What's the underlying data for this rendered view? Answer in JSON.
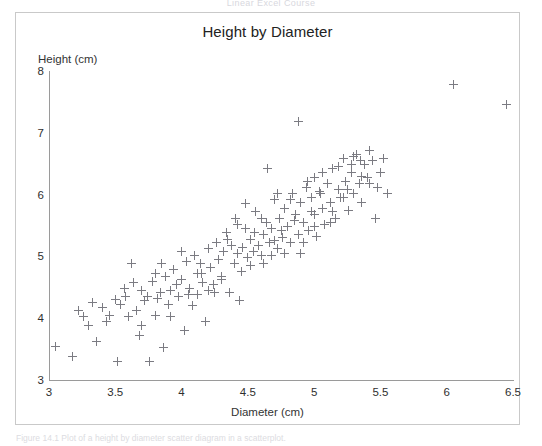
{
  "page": {
    "running_head": "Linear Excel Course",
    "figure_caption": "Figure 14.1  Plot of a height by diameter scatter diagram in a scatterplot."
  },
  "chart_data": {
    "type": "scatter",
    "title": "Height by Diameter",
    "xlabel": "Diameter (cm)",
    "ylabel": "Height (cm)",
    "xlim": [
      3,
      6.5
    ],
    "ylim": [
      3,
      8
    ],
    "xticks": [
      "3",
      "3.5",
      "4",
      "4.5",
      "5",
      "5.5",
      "6",
      "6.5"
    ],
    "xtick_values": [
      3,
      3.5,
      4,
      4.5,
      5,
      5.5,
      6,
      6.5
    ],
    "yticks": [
      "3",
      "4",
      "5",
      "6",
      "7",
      "8"
    ],
    "ytick_values": [
      3,
      4,
      5,
      6,
      7,
      8
    ],
    "grid": false,
    "legend": false,
    "marker": "plus",
    "marker_color": "#7b7b82",
    "point_count": 158,
    "points": [
      [
        3.05,
        3.55
      ],
      [
        3.18,
        3.38
      ],
      [
        3.22,
        4.12
      ],
      [
        3.26,
        4.02
      ],
      [
        3.3,
        3.88
      ],
      [
        3.33,
        4.25
      ],
      [
        3.36,
        3.62
      ],
      [
        3.4,
        4.18
      ],
      [
        3.43,
        3.95
      ],
      [
        3.46,
        4.05
      ],
      [
        3.5,
        4.3
      ],
      [
        3.52,
        3.3
      ],
      [
        3.54,
        4.22
      ],
      [
        3.57,
        4.48
      ],
      [
        3.6,
        4.02
      ],
      [
        3.62,
        4.88
      ],
      [
        3.64,
        4.58
      ],
      [
        3.66,
        4.12
      ],
      [
        3.68,
        3.72
      ],
      [
        3.7,
        4.45
      ],
      [
        3.72,
        4.28
      ],
      [
        3.74,
        4.35
      ],
      [
        3.76,
        3.3
      ],
      [
        3.78,
        4.6
      ],
      [
        3.8,
        4.72
      ],
      [
        3.8,
        4.05
      ],
      [
        3.82,
        4.32
      ],
      [
        3.84,
        4.42
      ],
      [
        3.86,
        3.52
      ],
      [
        3.88,
        4.68
      ],
      [
        3.9,
        4.22
      ],
      [
        3.92,
        4.02
      ],
      [
        3.94,
        4.78
      ],
      [
        3.96,
        4.55
      ],
      [
        3.98,
        4.35
      ],
      [
        4.0,
        4.62
      ],
      [
        4.02,
        3.8
      ],
      [
        4.04,
        4.92
      ],
      [
        4.06,
        4.48
      ],
      [
        4.08,
        4.2
      ],
      [
        4.1,
        5.02
      ],
      [
        4.12,
        4.72
      ],
      [
        4.14,
        4.88
      ],
      [
        4.16,
        4.58
      ],
      [
        4.18,
        3.95
      ],
      [
        4.2,
        5.12
      ],
      [
        4.22,
        4.82
      ],
      [
        4.24,
        4.55
      ],
      [
        4.26,
        5.22
      ],
      [
        4.28,
        4.95
      ],
      [
        4.3,
        4.68
      ],
      [
        4.32,
        5.08
      ],
      [
        4.34,
        5.38
      ],
      [
        4.36,
        4.42
      ],
      [
        4.38,
        5.18
      ],
      [
        4.4,
        4.88
      ],
      [
        4.41,
        5.62
      ],
      [
        4.42,
        5.05
      ],
      [
        4.44,
        4.28
      ],
      [
        4.46,
        5.15
      ],
      [
        4.48,
        5.45
      ],
      [
        4.5,
        4.98
      ],
      [
        4.52,
        5.28
      ],
      [
        4.54,
        5.08
      ],
      [
        4.56,
        5.72
      ],
      [
        4.58,
        5.18
      ],
      [
        4.6,
        5.02
      ],
      [
        4.62,
        5.35
      ],
      [
        4.64,
        5.55
      ],
      [
        4.65,
        6.42
      ],
      [
        4.66,
        5.22
      ],
      [
        4.68,
        5.45
      ],
      [
        4.7,
        5.92
      ],
      [
        4.72,
        5.12
      ],
      [
        4.74,
        5.62
      ],
      [
        4.76,
        5.3
      ],
      [
        4.78,
        5.78
      ],
      [
        4.8,
        5.48
      ],
      [
        4.82,
        5.22
      ],
      [
        4.84,
        6.02
      ],
      [
        4.86,
        5.68
      ],
      [
        4.88,
        5.35
      ],
      [
        4.88,
        7.18
      ],
      [
        4.9,
        5.88
      ],
      [
        4.92,
        5.55
      ],
      [
        4.94,
        6.12
      ],
      [
        4.96,
        5.42
      ],
      [
        4.98,
        5.95
      ],
      [
        5.0,
        5.68
      ],
      [
        5.0,
        6.28
      ],
      [
        5.02,
        5.32
      ],
      [
        5.04,
        6.05
      ],
      [
        5.06,
        5.78
      ],
      [
        5.08,
        5.52
      ],
      [
        5.1,
        6.18
      ],
      [
        5.12,
        5.88
      ],
      [
        5.14,
        6.42
      ],
      [
        5.16,
        5.62
      ],
      [
        5.18,
        6.08
      ],
      [
        5.2,
        5.95
      ],
      [
        5.22,
        6.58
      ],
      [
        5.24,
        6.22
      ],
      [
        5.26,
        5.75
      ],
      [
        5.28,
        6.35
      ],
      [
        5.3,
        6.02
      ],
      [
        5.32,
        6.65
      ],
      [
        5.34,
        6.18
      ],
      [
        5.36,
        5.88
      ],
      [
        5.38,
        6.48
      ],
      [
        5.4,
        6.28
      ],
      [
        5.42,
        6.72
      ],
      [
        5.44,
        6.55
      ],
      [
        5.46,
        5.62
      ],
      [
        5.48,
        6.12
      ],
      [
        5.5,
        6.35
      ],
      [
        5.52,
        6.58
      ],
      [
        5.55,
        6.02
      ],
      [
        3.92,
        4.45
      ],
      [
        4.05,
        4.38
      ],
      [
        4.15,
        4.72
      ],
      [
        4.25,
        4.42
      ],
      [
        4.35,
        5.28
      ],
      [
        4.45,
        4.75
      ],
      [
        4.55,
        5.38
      ],
      [
        4.62,
        4.88
      ],
      [
        4.7,
        5.25
      ],
      [
        4.78,
        5.05
      ],
      [
        4.85,
        5.58
      ],
      [
        4.92,
        5.22
      ],
      [
        5.0,
        5.48
      ],
      [
        5.05,
        6.02
      ],
      [
        5.12,
        5.55
      ],
      [
        5.18,
        6.45
      ],
      [
        5.25,
        6.08
      ],
      [
        5.3,
        6.62
      ],
      [
        5.36,
        6.3
      ],
      [
        5.42,
        6.18
      ],
      [
        4.2,
        4.45
      ],
      [
        4.3,
        4.62
      ],
      [
        4.42,
        5.52
      ],
      [
        4.52,
        4.85
      ],
      [
        4.6,
        5.62
      ],
      [
        4.68,
        5.02
      ],
      [
        4.75,
        5.42
      ],
      [
        4.82,
        5.92
      ],
      [
        4.9,
        5.05
      ],
      [
        4.98,
        5.72
      ],
      [
        5.06,
        6.35
      ],
      [
        5.14,
        5.72
      ],
      [
        5.22,
        5.95
      ],
      [
        5.28,
        6.48
      ],
      [
        5.35,
        6.55
      ],
      [
        3.58,
        4.35
      ],
      [
        3.7,
        3.88
      ],
      [
        3.85,
        4.88
      ],
      [
        4.0,
        5.08
      ],
      [
        4.12,
        4.38
      ],
      [
        4.48,
        5.85
      ],
      [
        4.72,
        6.02
      ],
      [
        4.95,
        6.22
      ],
      [
        6.05,
        7.78
      ],
      [
        6.45,
        7.45
      ]
    ]
  }
}
